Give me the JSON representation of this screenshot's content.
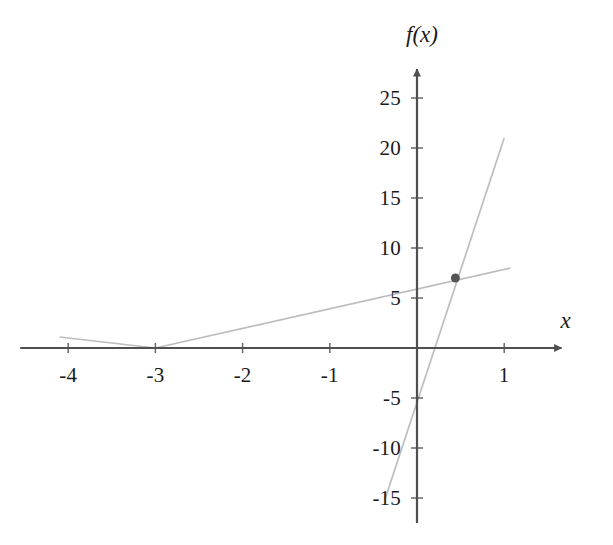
{
  "figure": {
    "background": "#ffffff",
    "axis_color": "#4f4f4f",
    "curve_color": "#bdbdbd",
    "point_color": "#555555",
    "label_color": "#1a1a1a"
  },
  "axis_labels": {
    "x": "x",
    "y": "f(x)"
  },
  "chart_data": {
    "type": "line",
    "title": "",
    "xlabel": "x",
    "ylabel": "f(x)",
    "xlim": [
      -4.55,
      1.75
    ],
    "ylim": [
      -17.5,
      28.5
    ],
    "grid": false,
    "legend": null,
    "x_ticks": [
      -4,
      -3,
      -2,
      -1,
      1
    ],
    "x_tick_labels": [
      "-4",
      "-3",
      "-2",
      "-1",
      "1"
    ],
    "y_ticks": [
      25,
      20,
      15,
      10,
      5,
      -5,
      -10,
      -15
    ],
    "y_tick_labels": [
      "25",
      "20",
      "15",
      "10",
      "5",
      "-5",
      "-10",
      "-15"
    ],
    "series": [
      {
        "name": "piecewise-v-line",
        "type": "line",
        "color": "#bdbdbd",
        "points": [
          [
            -4.1,
            1.1
          ],
          [
            -3.0,
            0.0
          ],
          [
            1.07,
            8.0
          ]
        ]
      },
      {
        "name": "steep-line",
        "type": "line",
        "color": "#bdbdbd",
        "points": [
          [
            -0.37,
            -15.2
          ],
          [
            1.0,
            21.0
          ]
        ]
      }
    ],
    "points": [
      {
        "name": "intersection-point",
        "x": 0.44,
        "y": 7.0,
        "color": "#555555",
        "radius": 4.5
      }
    ]
  }
}
